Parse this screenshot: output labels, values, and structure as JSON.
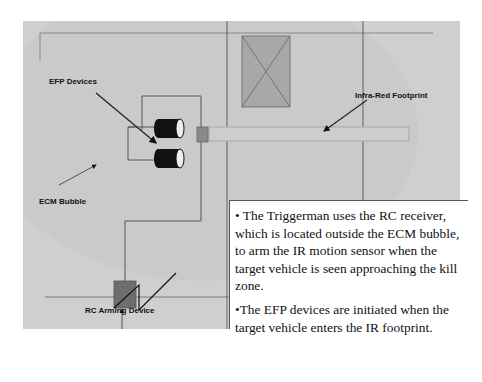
{
  "diagram": {
    "labels": {
      "efp_devices": "EFP Devices",
      "infra_red_footprint": "Infra-Red Footprint",
      "ecm_bubble": "ECM Bubble",
      "rc_arming_device": "RC Arming Device"
    },
    "components": [
      {
        "name": "efp-device",
        "shape": "cylinder",
        "count": 2,
        "color": "#111111"
      },
      {
        "name": "ir-sensor",
        "shape": "square",
        "color": "#8a8a8a"
      },
      {
        "name": "rc-receiver",
        "shape": "square-with-antenna",
        "color": "#6e6e6e"
      },
      {
        "name": "target-vehicle",
        "shape": "rectangle-with-x",
        "color": "#a8a8a8"
      },
      {
        "name": "ir-footprint",
        "shape": "beam",
        "color": "#c8c8c8"
      }
    ],
    "colors": {
      "background": "#cfcfcf",
      "ecm_bubble": "#c4c4c4",
      "lines": "#555555"
    }
  },
  "description": {
    "bullets": [
      "• The Triggerman uses the RC receiver, which is located outside the ECM bubble, to arm the IR motion sensor when the target vehicle is seen approaching the kill zone.",
      "•The EFP devices are initiated when the target vehicle enters the IR footprint."
    ]
  }
}
